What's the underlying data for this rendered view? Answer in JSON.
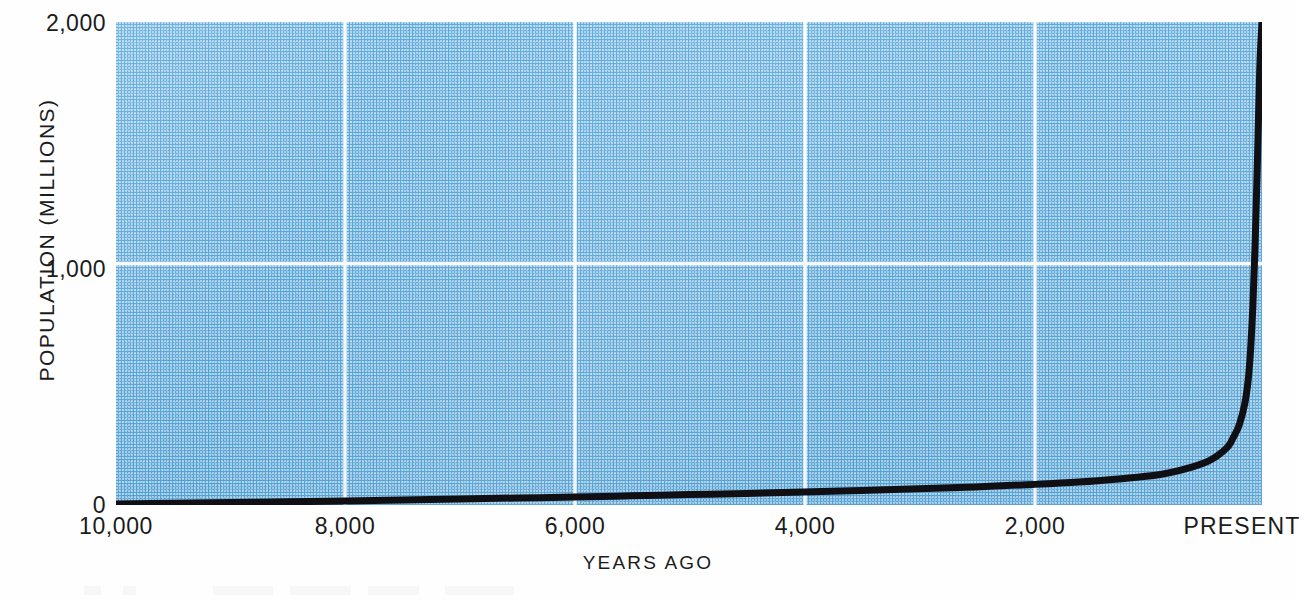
{
  "chart_data": {
    "type": "line",
    "title": "",
    "subtitle": "",
    "xlabel": "YEARS AGO",
    "ylabel": "POPULATION (MILLIONS)",
    "x_tick_labels": [
      "10,000",
      "8,000",
      "6,000",
      "4,000",
      "2,000",
      "PRESENT"
    ],
    "x_tick_values": [
      10000,
      8000,
      6000,
      4000,
      2000,
      0
    ],
    "y_tick_labels": [
      "0",
      "1,000",
      "2,000"
    ],
    "y_tick_values": [
      0,
      1000,
      2000
    ],
    "xlim": [
      10000,
      0
    ],
    "ylim": [
      0,
      2000
    ],
    "x_axis_direction": "reversed",
    "grid": true,
    "grid_color": "#ffffff",
    "grid_vertical_at": [
      8000,
      6000,
      4000,
      2000
    ],
    "grid_horizontal_at": [
      1000
    ],
    "legend": false,
    "legend_position": "none",
    "plot_background_color": "#57a6da",
    "line_color": "#101014",
    "line_width_px": 7,
    "series": [
      {
        "name": "World population",
        "x": [
          10000,
          9500,
          9000,
          8500,
          8000,
          7500,
          7000,
          6500,
          6000,
          5500,
          5000,
          4500,
          4000,
          3500,
          3000,
          2500,
          2000,
          1600,
          1200,
          900,
          700,
          500,
          400,
          300,
          250,
          200,
          150,
          120,
          100,
          80,
          60,
          40,
          20,
          0
        ],
        "y": [
          4,
          7,
          10,
          13,
          17,
          21,
          25,
          29,
          33,
          38,
          43,
          48,
          54,
          60,
          67,
          75,
          85,
          95,
          110,
          125,
          145,
          175,
          200,
          240,
          280,
          330,
          420,
          520,
          640,
          820,
          1080,
          1420,
          1800,
          2000
        ]
      }
    ],
    "annotations": []
  },
  "axes": {
    "y_ticks": [
      {
        "label": "2,000",
        "top": 10
      },
      {
        "label": "1,000",
        "top": 256
      },
      {
        "label": "0",
        "top": 492
      }
    ],
    "x_ticks": [
      {
        "label": "10,000",
        "center": 116,
        "present": false
      },
      {
        "label": "8,000",
        "center": 345,
        "present": false
      },
      {
        "label": "6,000",
        "center": 575,
        "present": false
      },
      {
        "label": "4,000",
        "center": 805,
        "present": false
      },
      {
        "label": "2,000",
        "center": 1035,
        "present": false
      },
      {
        "label": "PRESENT",
        "center": 1243,
        "present": true
      }
    ]
  },
  "colors": {
    "plot_fill": "#57a6da",
    "grid": "#ffffff",
    "curve": "#101014",
    "text": "#1b1b1b",
    "page_background": "#ffffff"
  }
}
